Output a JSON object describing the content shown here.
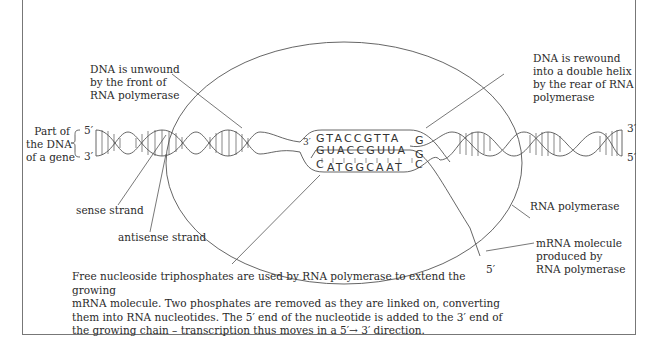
{
  "labels": {
    "unwound": [
      "DNA is unwound",
      "by the front of",
      "RNA polymerase"
    ],
    "rewound": [
      "DNA is rewound",
      "into a double helix",
      "by the rear of RNA",
      "polymerase"
    ],
    "gene_part": [
      "Part of",
      "the DNA",
      "of a gene"
    ],
    "sense": "sense strand",
    "antisense": "antisense strand",
    "polymerase": "RNA polymerase",
    "mrna": [
      "mRNA molecule",
      "produced by",
      "RNA polymerase"
    ]
  },
  "primes": {
    "left_top": "5′",
    "left_bottom": "3′",
    "right_top": "3′",
    "right_bottom": "5′",
    "bubble_left": "3′",
    "mrna_end": "5′"
  },
  "sequences": {
    "sense_strand": "GTACCGTTA",
    "sense_end": "G",
    "mrna": "GUACCGUUA",
    "mrna_end": "G",
    "antisense_start": "C",
    "antisense": "ATGGCAAT",
    "antisense_end": "C"
  },
  "caption": [
    "Free nucleoside triphosphates are used by RNA polymerase to extend the growing",
    "mRNA molecule. Two phosphates are removed as they are linked on, converting",
    "them into RNA nucleotides. The 5′ end of the nucleotide is added to the 3′ end of",
    "the growing chain – transcription thus moves in a 5′→ 3′ direction."
  ]
}
